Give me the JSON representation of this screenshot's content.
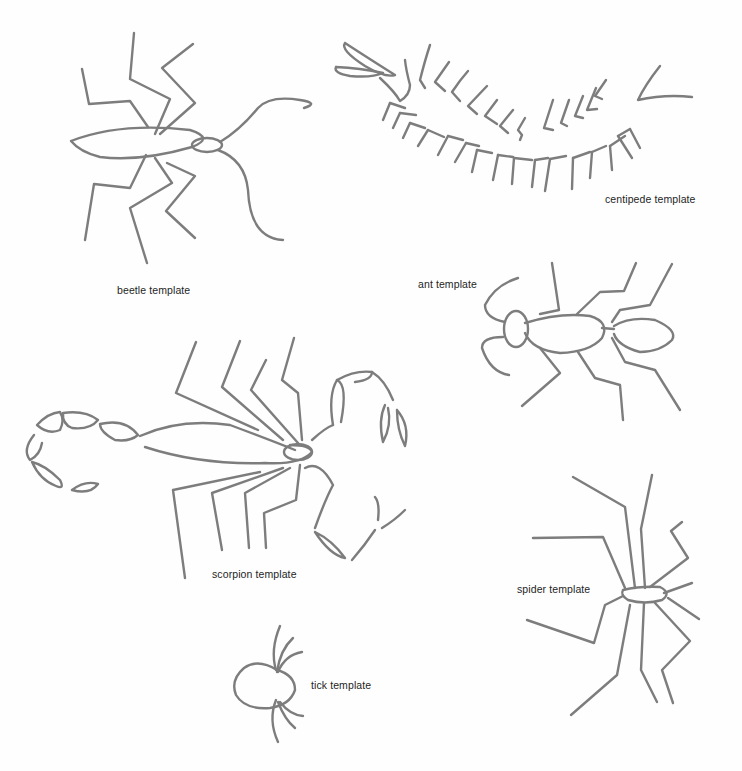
{
  "page": {
    "background": "#fefefe",
    "stroke_color": "#7d7d7d",
    "text_color": "#1e1e1e"
  },
  "templates": [
    {
      "id": "beetle",
      "label": "beetle template"
    },
    {
      "id": "centipede",
      "label": "centipede template"
    },
    {
      "id": "ant",
      "label": "ant template"
    },
    {
      "id": "scorpion",
      "label": "scorpion template"
    },
    {
      "id": "spider",
      "label": "spider template"
    },
    {
      "id": "tick",
      "label": "tick template"
    }
  ]
}
